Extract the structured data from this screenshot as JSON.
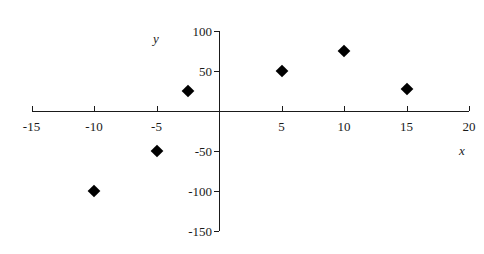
{
  "chart_data": {
    "type": "scatter",
    "title": "",
    "subtitle": "",
    "xlabel": "x",
    "ylabel": "y",
    "xlim": [
      -15,
      20
    ],
    "ylim": [
      -150,
      100
    ],
    "xticks": [
      -15,
      -10,
      -5,
      0,
      5,
      10,
      15,
      20
    ],
    "yticks": [
      -150,
      -100,
      -50,
      0,
      50,
      100
    ],
    "xtick_labels": [
      "-15",
      "-10",
      "-5",
      "",
      "5",
      "10",
      "15",
      "20"
    ],
    "ytick_labels": [
      "-150",
      "-100",
      "-50",
      "",
      "50",
      "100"
    ],
    "grid": false,
    "legend": null,
    "marker": "diamond",
    "marker_color": "#000000",
    "series": [
      {
        "name": "",
        "points": [
          {
            "x": -10,
            "y": -100
          },
          {
            "x": -5,
            "y": -50
          },
          {
            "x": -2.5,
            "y": 25
          },
          {
            "x": 5,
            "y": 50
          },
          {
            "x": 10,
            "y": 75
          },
          {
            "x": 15,
            "y": 27
          }
        ]
      }
    ],
    "annotations": []
  },
  "geometry": {
    "origin_x_px": 219,
    "origin_y_px": 111,
    "px_per_x_unit": 12.5,
    "px_per_y_unit": 0.8,
    "tick_len_px": 5,
    "axis_color": "#1a1a1a"
  }
}
